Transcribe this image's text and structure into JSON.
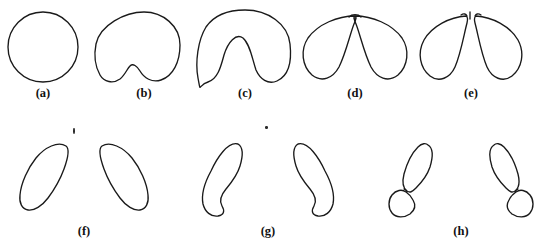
{
  "figure": {
    "kind": "line-drawing-figure",
    "background_color": "#ffffff",
    "stroke_color": "#1a1a1a",
    "width": 554,
    "height": 245,
    "rows": 2,
    "panels_per_row": [
      5,
      3
    ]
  },
  "labels": {
    "a": "(a)",
    "b": "(b)",
    "c": "(c)",
    "d": "(d)",
    "e": "(e)",
    "f": "(f)",
    "g": "(g)",
    "h": "(h)"
  },
  "panels": [
    {
      "id": "a",
      "label": "(a)",
      "description": "circle",
      "label_x": 43,
      "label_y": 91,
      "row": 1
    },
    {
      "id": "b",
      "label": "(b)",
      "description": "circle with shallow bottom notch",
      "label_x": 144,
      "label_y": 91,
      "row": 1
    },
    {
      "id": "c",
      "label": "(c)",
      "description": "rounded shape with deep bottom notch",
      "label_x": 245,
      "label_y": 91,
      "row": 1
    },
    {
      "id": "d",
      "label": "(d)",
      "description": "two lobes joined at top, notch nearly through",
      "label_x": 355,
      "label_y": 91,
      "row": 1
    },
    {
      "id": "e",
      "label": "(e)",
      "description": "two lobes separated at top, pinch-off complete",
      "label_x": 471,
      "label_y": 91,
      "row": 1
    },
    {
      "id": "f",
      "label": "(f)",
      "description": "pair of mirrored teardrop lobes",
      "label_x": 84,
      "label_y": 229,
      "row": 2
    },
    {
      "id": "g",
      "label": "(g)",
      "description": "pair of mirrored curved comma lobes",
      "label_x": 268,
      "label_y": 229,
      "row": 2
    },
    {
      "id": "h",
      "label": "(h)",
      "description": "pair of mirrored commas each pinching into two blobs",
      "label_x": 461,
      "label_y": 229,
      "row": 2
    }
  ],
  "specks": [
    {
      "name": "scan-speck-1",
      "x": 73,
      "y": 128,
      "w": 2,
      "h": 6
    },
    {
      "name": "scan-speck-2",
      "x": 265,
      "y": 126,
      "w": 3,
      "h": 3
    }
  ]
}
